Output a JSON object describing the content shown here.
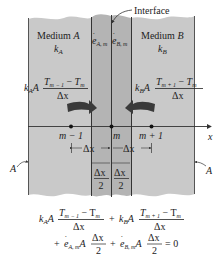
{
  "diagram": {
    "colors": {
      "medium_fill": "#c9c9c9",
      "strip_fill": "#b4b4b4",
      "line": "#333333",
      "arrow": "#3a3a3a"
    },
    "labels": {
      "interface": "Interface",
      "medium_a": "Medium",
      "medium_a_letter": "A",
      "medium_b": "Medium",
      "medium_b_letter": "B",
      "k": "k",
      "k_a_sub": "A",
      "k_b_sub": "B",
      "e": "e",
      "e_a_sub": "A, m",
      "e_b_sub": "B, m",
      "area_left": "A",
      "area_right": "A",
      "axis_x": "x",
      "node_left": "m − 1",
      "node_mid": "m",
      "node_right": "m + 1",
      "dx": "Δx",
      "two": "2"
    },
    "flux_left": {
      "k": "k",
      "sub": "A",
      "A": "A",
      "num_T1": "T",
      "num_T1_sub": "m − 1",
      "minus": " − ",
      "num_T2": "T",
      "num_T2_sub": "m",
      "den": "Δx"
    },
    "flux_right": {
      "k": "k",
      "sub": "B",
      "A": "A",
      "num_T1": "T",
      "num_T1_sub": "m + 1",
      "minus": " − ",
      "num_T2": "T",
      "num_T2_sub": "m",
      "den": "Δx"
    },
    "equation": {
      "line1_term1_k": "k",
      "line1_term1_sub": "A",
      "line1_term1_A": "A",
      "line1_num1": "T",
      "line1_num1_sub": "m − 1",
      "line1_num1_minus": " − T",
      "line1_num1_sub2": "m",
      "line1_den": "Δx",
      "plus": "+",
      "line1_term2_k": "k",
      "line1_term2_sub": "B",
      "line1_term2_A": "A",
      "line1_num2": "T",
      "line1_num2_sub": "m + 1",
      "line1_num2_minus": " − T",
      "line1_num2_sub2": "m",
      "line2_plus1": "+",
      "line2_e": "e",
      "line2_e1_sub": "A, m",
      "line2_A": "A",
      "line2_num": "Δx",
      "line2_den": "2",
      "line2_plus2": "+",
      "line2_e2_sub": "B, m",
      "equals_zero": "= 0"
    }
  }
}
